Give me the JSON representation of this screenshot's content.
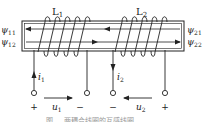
{
  "diagram": {
    "coils": [
      {
        "label_base": "L",
        "label_sub": "1"
      },
      {
        "label_base": "L",
        "label_sub": "2"
      }
    ],
    "flux_labels_left": [
      {
        "base": "ψ",
        "sub": "11"
      },
      {
        "base": "ψ",
        "sub": "12"
      }
    ],
    "flux_labels_right": [
      {
        "base": "ψ",
        "sub": "21"
      },
      {
        "base": "ψ",
        "sub": "22"
      }
    ],
    "currents": [
      {
        "base": "i",
        "sub": "1",
        "direction": "up"
      },
      {
        "base": "i",
        "sub": "2",
        "direction": "down"
      }
    ],
    "voltages": [
      {
        "base": "u",
        "sub": "1",
        "plus": "+",
        "minus": "−",
        "direction": "right"
      },
      {
        "base": "u",
        "sub": "2",
        "plus": "+",
        "minus": "−",
        "direction": "left"
      }
    ],
    "flux_line_directions": [
      "left",
      "right"
    ],
    "caption": "图 … 两耦合线圈的互感线圈"
  },
  "colors": {
    "stroke": "#222222",
    "caption": "#9a9a9a"
  }
}
